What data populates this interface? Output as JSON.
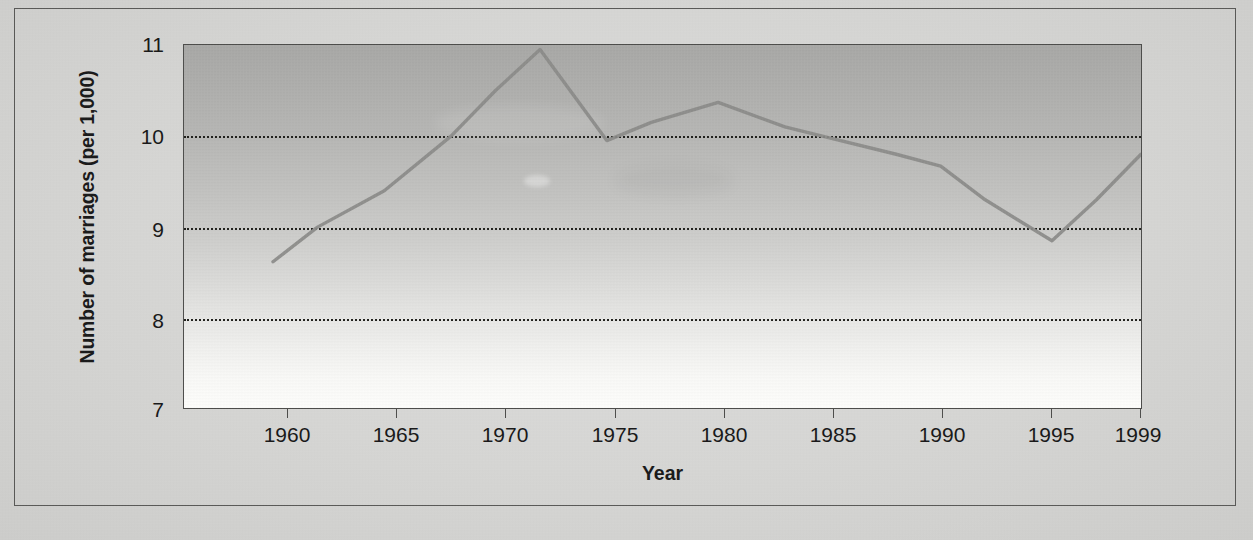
{
  "figure": {
    "background_color": "#d8d8d6",
    "plot_fill_top_color": "#a9a9a7",
    "plot_fill_bottom_color": "#fdfdfb",
    "line_color": "#8c8c8a",
    "axis_color": "#4e4e4c",
    "gridline_color": "#23231f"
  },
  "chart_data": {
    "type": "line",
    "title": "",
    "xlabel": "Year",
    "ylabel": "Number of marriages (per 1,000)",
    "xlim": [
      1956,
      1999
    ],
    "ylim": [
      7,
      11
    ],
    "grid": true,
    "gridlines_y": [
      10,
      9,
      8
    ],
    "legend_position": "none",
    "x_tick_labels": [
      "1960",
      "1965",
      "1970",
      "1975",
      "1980",
      "1985",
      "1990",
      "1995",
      "1999"
    ],
    "x_ticks": [
      1960,
      1965,
      1970,
      1975,
      1980,
      1985,
      1990,
      1995,
      1999
    ],
    "y_tick_labels": [
      "11",
      "10",
      "9",
      "8",
      "7"
    ],
    "y_ticks": [
      11,
      10,
      9,
      8,
      7
    ],
    "series": [
      {
        "name": "Number of marriages per 1,000",
        "x": [
          1960,
          1962,
          1965,
          1968,
          1970,
          1972,
          1975,
          1977,
          1980,
          1983,
          1985,
          1988,
          1990,
          1992,
          1995,
          1997,
          1999
        ],
        "values": [
          8.62,
          9.0,
          9.4,
          10.0,
          10.5,
          10.95,
          9.95,
          10.15,
          10.37,
          10.1,
          9.98,
          9.8,
          9.67,
          9.3,
          8.85,
          9.3,
          9.8
        ]
      }
    ]
  }
}
